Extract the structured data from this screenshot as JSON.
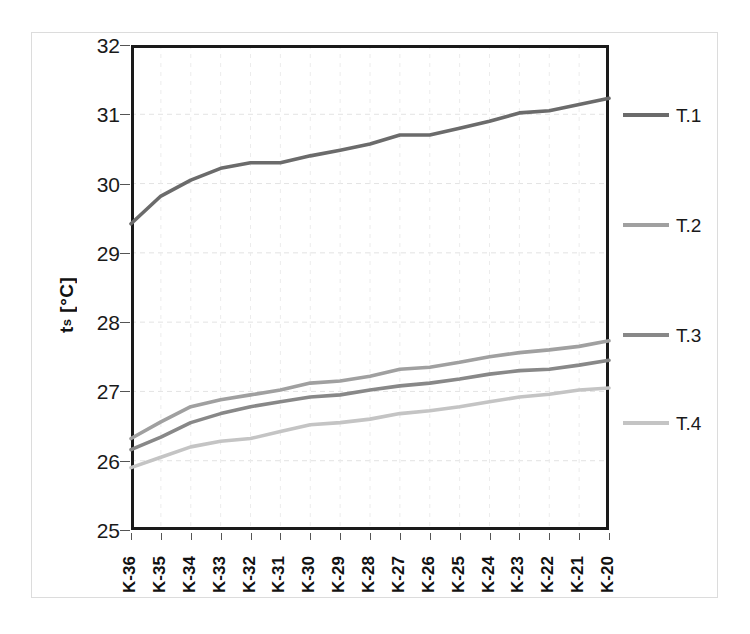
{
  "figure": {
    "background_color": "#ffffff",
    "frame_color": "#dcdcdc",
    "axis_color": "#1a1a1a"
  },
  "axes": {
    "y_title_main": "t",
    "y_title_sub": "s",
    "y_title_unit": " [°C]",
    "y_title_full": "ts [°C]"
  },
  "legend": {
    "position": "right",
    "items": [
      {
        "label": "T.1",
        "color": "#6b6b6b"
      },
      {
        "label": "T.2",
        "color": "#a0a0a0"
      },
      {
        "label": "T.3",
        "color": "#888888"
      },
      {
        "label": "T.4",
        "color": "#c4c4c4"
      }
    ]
  },
  "chart_data": {
    "type": "line",
    "title": "",
    "xlabel": "",
    "ylabel": "ts [°C]",
    "ylim": [
      25,
      32
    ],
    "yticks": [
      25,
      26,
      27,
      28,
      29,
      30,
      31,
      32
    ],
    "ytick_labels": [
      "25",
      "26",
      "27",
      "28",
      "29",
      "30",
      "31",
      "32"
    ],
    "grid": true,
    "grid_style": "dashed-faint",
    "legend_position": "right",
    "categories": [
      "K-36",
      "K-35",
      "K-34",
      "K-33",
      "K-32",
      "K-31",
      "K-30",
      "K-29",
      "K-28",
      "K-27",
      "K-26",
      "K-25",
      "K-24",
      "K-23",
      "K-22",
      "K-21",
      "K-20"
    ],
    "series": [
      {
        "name": "T.1",
        "color": "#6b6b6b",
        "values": [
          29.42,
          29.82,
          30.05,
          30.22,
          30.3,
          30.3,
          30.4,
          30.48,
          30.57,
          30.7,
          30.7,
          30.8,
          30.9,
          31.02,
          31.05,
          31.14,
          31.23
        ]
      },
      {
        "name": "T.2",
        "color": "#a0a0a0",
        "values": [
          26.32,
          26.56,
          26.78,
          26.88,
          26.95,
          27.02,
          27.12,
          27.15,
          27.22,
          27.32,
          27.35,
          27.42,
          27.5,
          27.56,
          27.6,
          27.65,
          27.73
        ]
      },
      {
        "name": "T.3",
        "color": "#888888",
        "values": [
          26.16,
          26.34,
          26.55,
          26.68,
          26.78,
          26.85,
          26.92,
          26.95,
          27.02,
          27.08,
          27.12,
          27.18,
          27.25,
          27.3,
          27.32,
          27.38,
          27.45
        ]
      },
      {
        "name": "T.4",
        "color": "#c4c4c4",
        "values": [
          25.9,
          26.05,
          26.2,
          26.28,
          26.32,
          26.42,
          26.52,
          26.55,
          26.6,
          26.68,
          26.72,
          26.78,
          26.85,
          26.92,
          26.96,
          27.02,
          27.05
        ]
      }
    ]
  }
}
